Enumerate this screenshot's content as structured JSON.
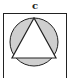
{
  "figure": {
    "label": "c",
    "colors": {
      "stroke": "#222222",
      "circle_fill": "#cfcfcf",
      "triangle_fill": "#ffffff",
      "background": "#ffffff"
    },
    "shapes": {
      "square": {
        "x": 3.5,
        "y": 13.5,
        "width": 63,
        "height": 70
      },
      "circle": {
        "cx": 34,
        "cy": 42,
        "r": 24
      },
      "triangle": {
        "points": "34,18 12,58 56,58"
      }
    }
  }
}
